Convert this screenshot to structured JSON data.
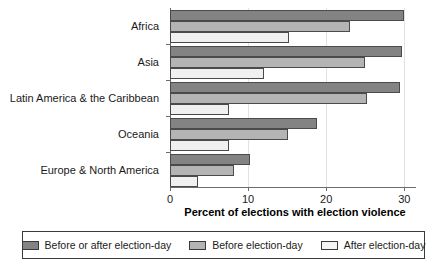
{
  "chart_data": {
    "type": "bar",
    "orientation": "horizontal",
    "title": "",
    "xlabel": "Percent of elections with election violence",
    "ylabel": "",
    "xlim": [
      0,
      31.5
    ],
    "xticks": [
      0,
      10,
      20,
      30
    ],
    "xtick_labels": [
      "0",
      "10",
      "20",
      "30"
    ],
    "grid": true,
    "grid_axis": "x",
    "legend_position": "bottom",
    "categories": [
      "Africa",
      "Asia",
      "Latin America & the Caribbean",
      "Oceania",
      "Europe & North America"
    ],
    "series": [
      {
        "name": "Before or after election-day",
        "color": "#838383",
        "values": [
          30.0,
          29.7,
          29.4,
          18.8,
          10.3
        ]
      },
      {
        "name": "Before election-day",
        "color": "#b4b4b4",
        "values": [
          23.0,
          25.0,
          25.2,
          15.1,
          8.2
        ]
      },
      {
        "name": "After election-day",
        "color": "#f0f0f0",
        "values": [
          15.3,
          12.0,
          7.5,
          7.5,
          3.6
        ]
      }
    ]
  },
  "axis": {
    "xlabel": "Percent of elections with election violence"
  },
  "legend": {
    "items": [
      {
        "label": "Before or after election-day",
        "swatch": "dark-gray-swatch"
      },
      {
        "label": "Before election-day",
        "swatch": "medium-gray-swatch"
      },
      {
        "label": "After election-day",
        "swatch": "light-gray-swatch"
      }
    ]
  }
}
